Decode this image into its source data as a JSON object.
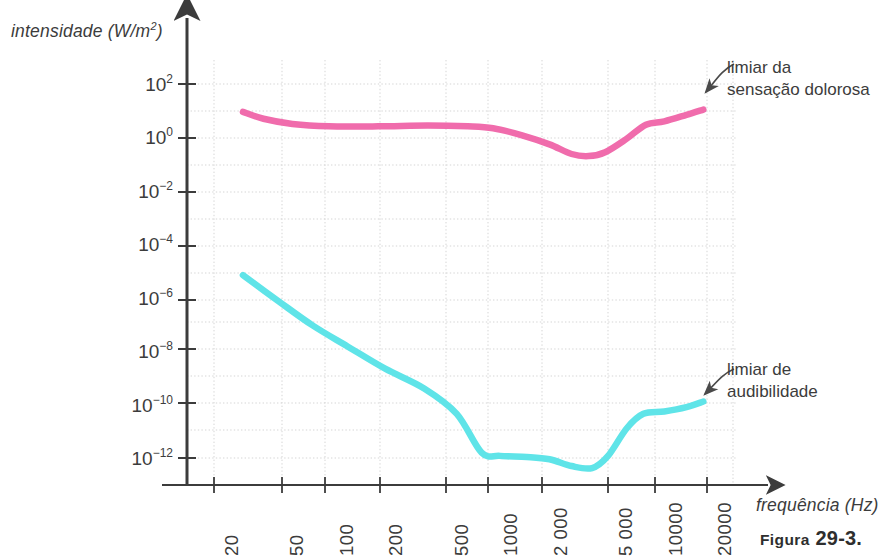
{
  "chart_data": {
    "type": "line",
    "title": "",
    "caption_prefix": "Figura",
    "caption_number": "29-3.",
    "xlabel": "frequência (Hz)",
    "ylabel_text": "intensidade (W/m",
    "ylabel_exponent": "2",
    "ylabel_suffix": ")",
    "xscale": "log",
    "yscale": "log",
    "xlim": [
      16,
      26000
    ],
    "ylim": [
      1e-13,
      1000
    ],
    "grid": true,
    "legend_position": "inline-annotations",
    "x_ticks": [
      {
        "value": 20,
        "label": "20"
      },
      {
        "value": 50,
        "label": "50"
      },
      {
        "value": 100,
        "label": "100"
      },
      {
        "value": 200,
        "label": "200"
      },
      {
        "value": 500,
        "label": "500"
      },
      {
        "value": 1000,
        "label": "1000"
      },
      {
        "value": 2000,
        "label": "2 000"
      },
      {
        "value": 5000,
        "label": "5 000"
      },
      {
        "value": 10000,
        "label": "10000"
      },
      {
        "value": 20000,
        "label": "20000"
      }
    ],
    "y_ticks": [
      {
        "value": 100,
        "mantissa": "10",
        "exponent": "2"
      },
      {
        "value": 1,
        "mantissa": "10",
        "exponent": "0"
      },
      {
        "value": 0.01,
        "mantissa": "10",
        "exponent": "−2"
      },
      {
        "value": 0.0001,
        "mantissa": "10",
        "exponent": "−4"
      },
      {
        "value": 1e-06,
        "mantissa": "10",
        "exponent": "−6"
      },
      {
        "value": 1e-08,
        "mantissa": "10",
        "exponent": "−8"
      },
      {
        "value": 1e-10,
        "mantissa": "10",
        "exponent": "−10"
      },
      {
        "value": 1e-12,
        "mantissa": "10",
        "exponent": "−12"
      }
    ],
    "series": [
      {
        "name": "limiar da sensação dolorosa",
        "color": "#F06CAC",
        "annotation_line1": "limiar da",
        "annotation_line2": "sensação dolorosa",
        "points": [
          [
            30,
            9.0
          ],
          [
            40,
            5.0
          ],
          [
            60,
            3.2
          ],
          [
            100,
            2.6
          ],
          [
            200,
            2.6
          ],
          [
            400,
            2.8
          ],
          [
            700,
            2.6
          ],
          [
            1000,
            2.2
          ],
          [
            1500,
            1.2
          ],
          [
            2200,
            0.55
          ],
          [
            3000,
            0.24
          ],
          [
            3800,
            0.2
          ],
          [
            4800,
            0.28
          ],
          [
            6500,
            0.9
          ],
          [
            8500,
            3.0
          ],
          [
            11000,
            4.0
          ],
          [
            15000,
            7.0
          ],
          [
            19000,
            11.0
          ]
        ]
      },
      {
        "name": "limiar de audibilidade",
        "color": "#5FE4E8",
        "annotation_line1": "limiar de",
        "annotation_line2": "audibilidade",
        "points": [
          [
            30,
            7e-06
          ],
          [
            50,
            7e-07
          ],
          [
            80,
            9e-08
          ],
          [
            130,
            1.5e-08
          ],
          [
            220,
            2.2e-09
          ],
          [
            380,
            4e-10
          ],
          [
            600,
            4.5e-11
          ],
          [
            850,
            1.6e-12
          ],
          [
            1100,
            1.2e-12
          ],
          [
            1600,
            1.1e-12
          ],
          [
            2200,
            9e-13
          ],
          [
            3000,
            5e-13
          ],
          [
            4000,
            4.2e-13
          ],
          [
            5000,
            1.2e-12
          ],
          [
            6500,
            1.3e-11
          ],
          [
            8200,
            4.5e-11
          ],
          [
            11000,
            5.5e-11
          ],
          [
            15000,
            8e-11
          ],
          [
            19000,
            1.3e-10
          ]
        ]
      }
    ],
    "annotations": [
      {
        "id": "pain-threshold",
        "text_line1": "limiar da",
        "text_line2": "sensação dolorosa",
        "arrow_target_series": "limiar da sensação dolorosa"
      },
      {
        "id": "hearing-threshold",
        "text_line1": "limiar de",
        "text_line2": "audibilidade",
        "arrow_target_series": "limiar de audibilidade"
      }
    ],
    "colors": {
      "pain_curve": "#F06CAC",
      "hearing_curve": "#5FE4E8",
      "axis": "#3c3c3c",
      "grid": "#d9d9d9",
      "background": "#ffffff"
    }
  }
}
